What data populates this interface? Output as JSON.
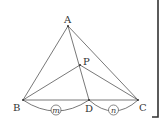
{
  "diagram": {
    "type": "triangle-geometry",
    "points": {
      "A": {
        "label": "A",
        "x": 68,
        "y": 26
      },
      "B": {
        "label": "B",
        "x": 23,
        "y": 100
      },
      "C": {
        "label": "C",
        "x": 138,
        "y": 100
      },
      "D": {
        "label": "D",
        "x": 89,
        "y": 100
      },
      "P": {
        "label": "P",
        "x": 80,
        "y": 65
      }
    },
    "segments": [
      "AB",
      "AC",
      "BC",
      "AD",
      "BP",
      "PC"
    ],
    "ratio_labels": {
      "BD": "m",
      "DC": "n"
    }
  }
}
